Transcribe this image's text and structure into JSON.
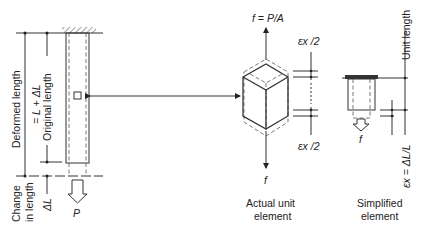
{
  "diagram": {
    "bar": {
      "deformed_length_label": "Deformed length",
      "deformed_length_eq": "= L + ΔL",
      "original_length_label": "Original length",
      "change_label_1": "Change",
      "change_label_2": "in length",
      "change_delta": "ΔL",
      "load_label": "P"
    },
    "actual_element": {
      "top_stress_label": "f = P/A",
      "bottom_stress_label": "f",
      "strain_top_label": "εx /2",
      "strain_bottom_label": "εx /2",
      "caption_line1": "Actual unit",
      "caption_line2": "element"
    },
    "simplified_element": {
      "unit_length_label": "Unit length",
      "strain_label": "εx = ΔL/L",
      "load_label": "f",
      "caption_line1": "Simplified",
      "caption_line2": "element"
    }
  }
}
